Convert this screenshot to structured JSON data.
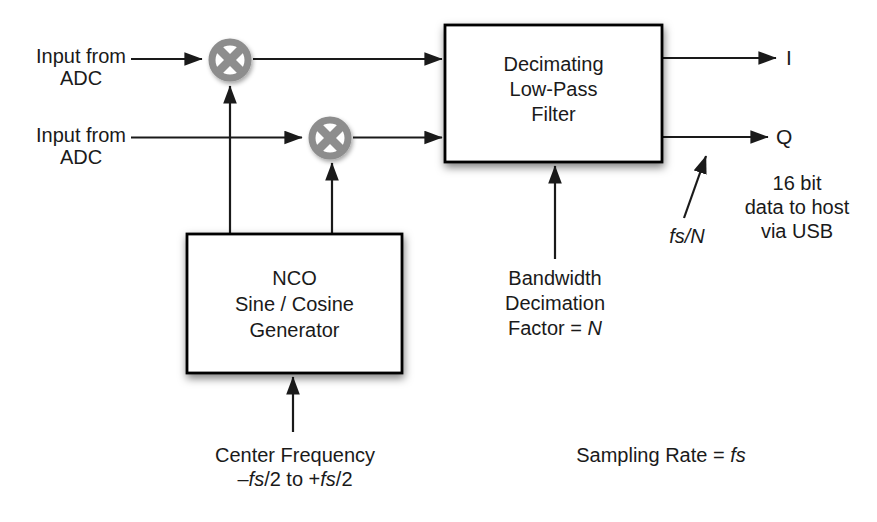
{
  "colors": {
    "line": "#1a1a1a",
    "mixer_gray": "#8d8d8d",
    "box_fill": "#ffffff",
    "box_border": "#000000"
  },
  "labels": {
    "input_top": {
      "line1": "Input from",
      "line2": "ADC"
    },
    "input_bottom": {
      "line1": "Input from",
      "line2": "ADC"
    },
    "filter_block": {
      "line1": "Decimating",
      "line2": "Low-Pass",
      "line3": "Filter"
    },
    "nco_block": {
      "line1": "NCO",
      "line2": "Sine / Cosine",
      "line3": "Generator"
    },
    "output_i": "I",
    "output_q": "Q",
    "output_rate": "fs/N",
    "usb_note": {
      "line1": "16 bit",
      "line2": "data to host",
      "line3": "via USB"
    },
    "bandwidth_note": {
      "line1": "Bandwidth",
      "line2": "Decimation",
      "line3_text": "Factor = ",
      "line3_var": "N"
    },
    "center_freq": {
      "line1": "Center Frequency",
      "l2_dash": "–",
      "l2_fs1": "fs",
      "l2_mid": "/2 to +",
      "l2_fs2": "fs",
      "l2_end": "/2"
    },
    "sampling_rate": {
      "text": "Sampling Rate = ",
      "var": "fs"
    }
  }
}
